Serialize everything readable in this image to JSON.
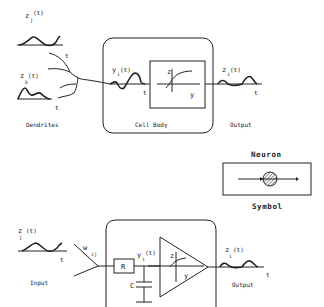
{
  "biological": {
    "input_j": {
      "label": "z",
      "sub": "j",
      "arg": "(t)",
      "axis": "t"
    },
    "input_k": {
      "label": "z",
      "sub": "k",
      "arg": "(t)",
      "axis": "t"
    },
    "dendrites_label": "Dendrites",
    "cell_body_label": "Cell Body",
    "potential": {
      "label": "y",
      "sub": "i",
      "arg": "(t)",
      "axis": "t"
    },
    "transfer_fn": {
      "z_axis": "z",
      "y_axis": "y"
    },
    "output": {
      "label": "z",
      "sub": "i",
      "arg": "(t)",
      "axis": "t"
    },
    "output_label": "Output"
  },
  "symbol": {
    "title": "Neuron",
    "caption": "Symbol"
  },
  "electrical": {
    "input": {
      "label": "z",
      "sub": "j",
      "arg": "(t)",
      "axis": "t"
    },
    "input_label": "Input",
    "weight": {
      "label": "w",
      "sub": "ij"
    },
    "resistor_label": "R",
    "capacitor_label": "C",
    "potential": {
      "label": "y",
      "sub": "i",
      "arg": "(t)"
    },
    "amp_axes": {
      "z_axis": "z",
      "y_axis": "y"
    },
    "output": {
      "label": "z",
      "sub": "i",
      "arg": "(t)",
      "axis": "t"
    },
    "output_label": "Output"
  }
}
